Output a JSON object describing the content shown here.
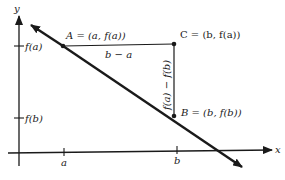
{
  "diagram": {
    "type": "secant-line-slope",
    "axes": {
      "x_label": "x",
      "y_label": "y",
      "x_ticks": [
        "a",
        "b"
      ],
      "y_ticks": [
        "f(a)",
        "f(b)"
      ]
    },
    "points": {
      "A": {
        "label": "A = (a, f(a))"
      },
      "B": {
        "label": "B = (b, f(b))"
      },
      "C": {
        "label": "C = (b, f(a))"
      }
    },
    "segments": {
      "horizontal": "b − a",
      "vertical": "f(a) − f(b)"
    },
    "colors": {
      "ink": "#1a1a1a",
      "background": "#ffffff"
    }
  }
}
